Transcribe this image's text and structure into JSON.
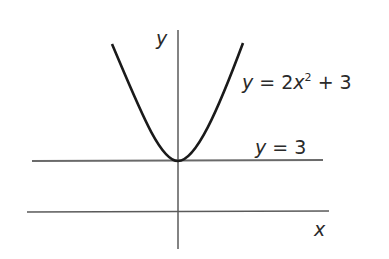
{
  "figure": {
    "axis_labels": {
      "x": "x",
      "y": "y"
    },
    "curve_label": {
      "lhs": "y",
      "eq": " = 2",
      "var": "x",
      "exp": "2",
      "rest": " + 3"
    },
    "line_label": {
      "lhs": "y",
      "eq": " = 3"
    },
    "colors": {
      "curve": "#1a1a1a",
      "axes": "#5a5a5a",
      "line": "#6a6a6a",
      "text": "#2a2a2a"
    }
  }
}
